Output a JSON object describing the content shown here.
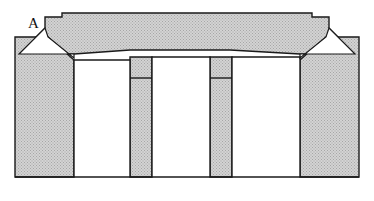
{
  "figure": {
    "type": "engineering-cross-section",
    "background_color": "#ffffff",
    "fill_color": "#c9c9c9",
    "hatch_dot_color": "#9a9a9a",
    "outline_color": "#1a1a1a",
    "cavity_color": "#ffffff",
    "outline_width": 1.4,
    "canvas": {
      "width": 374,
      "height": 201
    }
  },
  "labels": [
    {
      "id": "callout-a",
      "text": "A",
      "x": 28,
      "y": 16,
      "font_size": 15,
      "color": "#111111",
      "points_to": "diagonal-clearance-slot"
    }
  ],
  "parts": [
    {
      "id": "top-plate",
      "name": "top-plate",
      "description": "Upper punch plate with stepped notches at both ends and chamfered underside ends",
      "fill": "#c9c9c9",
      "points": "45,17 62,17 62,13 312,13 312,17 329,17 329,28 355,54 300,54 230,50 210,50 152,50 130,50 74,54 19,54 45,28"
    },
    {
      "id": "base-block-left",
      "name": "base-block-left",
      "description": "Left outer die block with chamfered top-right corner",
      "fill": "#c9c9c9",
      "points": "15,37 48,37 74,60 74,177 15,177"
    },
    {
      "id": "base-block-right",
      "name": "base-block-right",
      "description": "Right outer die block with chamfered top-left corner",
      "fill": "#c9c9c9",
      "points": "359,37 326,37 300,60 300,177 359,177"
    },
    {
      "id": "pillar-left",
      "name": "pillar-left",
      "description": "Left inner pillar between cavity 1 and cavity 2, stepped shoulder",
      "fill": "#c9c9c9",
      "points": "130,57 152,57 152,78 152,177 130,177 130,78"
    },
    {
      "id": "pillar-right",
      "name": "pillar-right",
      "description": "Right inner pillar between cavity 2 and cavity 3, stepped shoulder",
      "fill": "#c9c9c9",
      "points": "210,57 232,57 232,78 232,177 210,177 210,78"
    }
  ],
  "cavities": [
    {
      "id": "cavity-1",
      "name": "cavity-left",
      "x": 74,
      "y": 60,
      "width": 56,
      "height": 117
    },
    {
      "id": "cavity-2",
      "name": "cavity-center",
      "x": 152,
      "y": 57,
      "width": 58,
      "height": 120
    },
    {
      "id": "cavity-3",
      "name": "cavity-right",
      "x": 232,
      "y": 57,
      "width": 68,
      "height": 120
    }
  ],
  "detail_lines": [
    {
      "id": "step-left",
      "name": "pillar-left-shoulder-line",
      "x1": 130,
      "y1": 78,
      "x2": 152,
      "y2": 78
    },
    {
      "id": "step-right",
      "name": "pillar-right-shoulder-line",
      "x1": 210,
      "y1": 78,
      "x2": 232,
      "y2": 78
    },
    {
      "id": "baseline",
      "name": "base-bottom-line",
      "x1": 15,
      "y1": 177,
      "x2": 359,
      "y2": 177
    }
  ],
  "slots": [
    {
      "id": "diagonal-clearance-slot-left",
      "name": "diagonal-clearance-slot",
      "description": "Thin white angular clearance gap between top plate chamfer and left base block, marked A",
      "points": "45,28 48,37 74,58 74,54 19,54"
    },
    {
      "id": "diagonal-clearance-slot-right",
      "name": "diagonal-clearance-slot-mirror",
      "description": "Thin white angular clearance gap between top plate chamfer and right base block",
      "points": "329,28 326,37 300,58 300,54 355,54"
    }
  ]
}
